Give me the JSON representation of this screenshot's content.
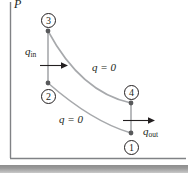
{
  "figure": {
    "type": "pv-diagram",
    "background_color": "#ffffff",
    "axes": {
      "y_label": "P",
      "axis_color": "#808285",
      "y_axis": {
        "x": 10,
        "y_top": 2,
        "y_bottom": 158
      },
      "x_axis": {
        "y": 158,
        "x_left": 10,
        "x_right": 186
      }
    },
    "curve_color": "#a7a9ac",
    "marker_color": "#58595b",
    "text_color": "#231f20",
    "states": [
      {
        "id": "1",
        "label": "1",
        "x": 131,
        "y": 133,
        "label_x": 131,
        "label_y": 147
      },
      {
        "id": "2",
        "label": "2",
        "x": 48,
        "y": 83,
        "label_x": 48,
        "label_y": 96
      },
      {
        "id": "3",
        "label": "3",
        "x": 48,
        "y": 31,
        "label_x": 48,
        "label_y": 20
      },
      {
        "id": "4",
        "label": "4",
        "x": 131,
        "y": 103,
        "label_x": 131,
        "label_y": 92
      }
    ],
    "processes": [
      {
        "from": "2",
        "to": "3",
        "kind": "isobaric-heat-addition",
        "label": null
      },
      {
        "from": "3",
        "to": "4",
        "kind": "isentropic-expansion",
        "label": "q = 0",
        "label_x": 92,
        "label_y": 62
      },
      {
        "from": "4",
        "to": "1",
        "kind": "isobaric-heat-rejection",
        "label": null
      },
      {
        "from": "1",
        "to": "2",
        "kind": "isentropic-compression",
        "label": "q = 0",
        "label_x": 59,
        "label_y": 114
      }
    ],
    "heat_flows": [
      {
        "name": "q_in",
        "text": "q",
        "subscript": "in",
        "label_x": 25,
        "label_y": 46,
        "arrow": {
          "x1": 40,
          "y1": 65,
          "x2": 68,
          "y2": 65,
          "direction": "right"
        }
      },
      {
        "name": "q_out",
        "text": "q",
        "subscript": "out",
        "label_x": 143,
        "label_y": 126,
        "arrow": {
          "x1": 123,
          "y1": 120,
          "x2": 155,
          "y2": 120,
          "direction": "right"
        }
      }
    ],
    "bottom_bar": {
      "y": 165,
      "height": 8,
      "color": "#8d8d8d"
    }
  }
}
